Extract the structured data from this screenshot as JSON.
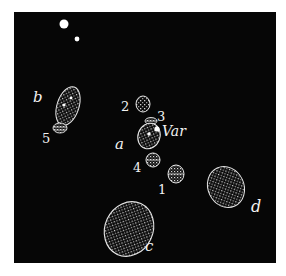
{
  "figure": {
    "type": "astronomical sketch of nebulous patches around a variable star",
    "background": "#060606",
    "foreground": "#f0f0f0",
    "stars": [
      {
        "name": "bright-star",
        "x": 64,
        "y": 24,
        "r": 4.5
      },
      {
        "name": "faint-star",
        "x": 77,
        "y": 39,
        "r": 2.5
      }
    ],
    "patches": [
      {
        "id": "b",
        "label": "b",
        "cx": 68,
        "cy": 107,
        "rx": 11,
        "ry": 20
      },
      {
        "id": "5",
        "label": "5",
        "cx": 60,
        "cy": 128,
        "rx": 7,
        "ry": 5
      },
      {
        "id": "2",
        "label": "2",
        "cx": 143,
        "cy": 104,
        "rx": 7,
        "ry": 8
      },
      {
        "id": "3",
        "label": "3",
        "cx": 151,
        "cy": 121,
        "rx": 6,
        "ry": 4
      },
      {
        "id": "a",
        "label": "a",
        "cx": 149,
        "cy": 136,
        "rx": 11,
        "ry": 13
      },
      {
        "id": "4",
        "label": "4",
        "cx": 153,
        "cy": 160,
        "rx": 7,
        "ry": 7
      },
      {
        "id": "1",
        "label": "1",
        "cx": 176,
        "cy": 174,
        "rx": 8,
        "ry": 9
      },
      {
        "id": "d",
        "label": "d",
        "cx": 226,
        "cy": 187,
        "rx": 18,
        "ry": 21
      },
      {
        "id": "c",
        "label": "c",
        "cx": 129,
        "cy": 229,
        "rx": 24,
        "ry": 28
      }
    ],
    "labels": {
      "b": "b",
      "five": "5",
      "two": "2",
      "three": "3",
      "var": "Var",
      "a": "a",
      "four": "4",
      "one": "1",
      "d": "d",
      "c": "c"
    }
  }
}
